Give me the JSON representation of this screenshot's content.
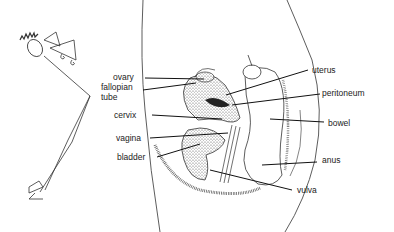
{
  "diagram": {
    "type": "anatomical-cross-section",
    "labels_left": [
      {
        "id": "ovary",
        "text": "ovary"
      },
      {
        "id": "fallopian-tube",
        "text": "fallopian\ntube",
        "line1": "fallopian",
        "line2": "tube"
      },
      {
        "id": "cervix",
        "text": "cervix"
      },
      {
        "id": "vagina",
        "text": "vagina"
      },
      {
        "id": "bladder",
        "text": "bladder"
      }
    ],
    "labels_right": [
      {
        "id": "uterus",
        "text": "uterus"
      },
      {
        "id": "peritoneum",
        "text": "peritoneum"
      },
      {
        "id": "bowel",
        "text": "bowel"
      },
      {
        "id": "anus",
        "text": "anus"
      },
      {
        "id": "vulva",
        "text": "vulva"
      }
    ],
    "colors": {
      "ink": "#222222",
      "background": "#ffffff",
      "stipple": "#555555"
    }
  }
}
